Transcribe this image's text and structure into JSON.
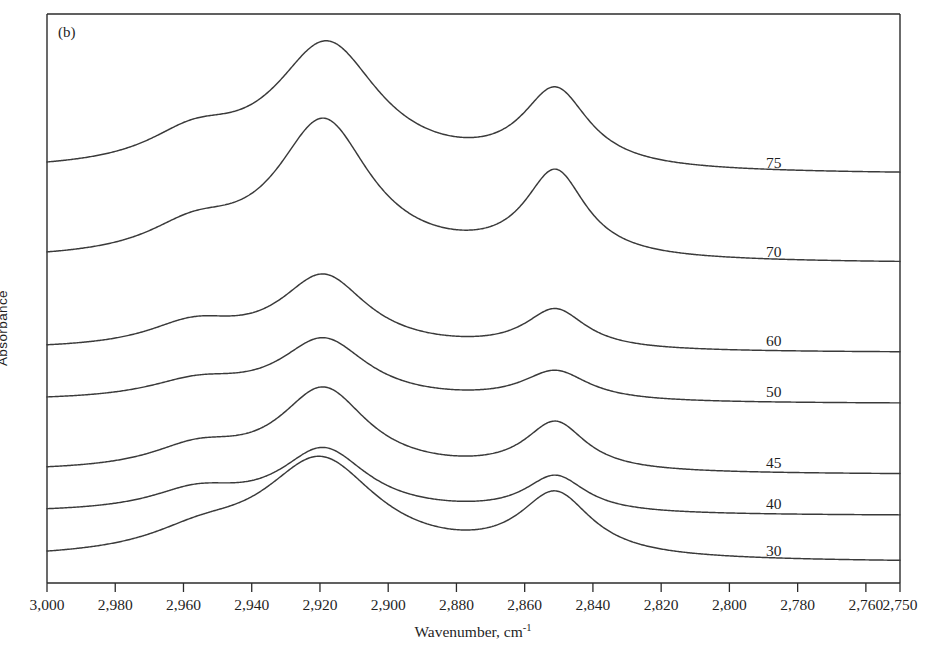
{
  "figure": {
    "panel_label": "(b)",
    "y_axis_label": "Absorbance",
    "x_axis_label": "Wavenumber, cm",
    "x_axis_label_sup": "-1"
  },
  "chart_data": {
    "type": "line",
    "title": "",
    "subtitle": "",
    "panel": "(b)",
    "xlabel": "Wavenumber, cm^-1",
    "ylabel": "Absorbance",
    "xlim": [
      3000,
      2750
    ],
    "x_axis_reversed": true,
    "ylim_units": "arbitrary (stacked offset traces)",
    "grid": false,
    "legend": "inline right-side curve labels",
    "xticks": [
      3000,
      2980,
      2960,
      2940,
      2920,
      2900,
      2880,
      2860,
      2840,
      2820,
      2800,
      2780,
      2760,
      2750
    ],
    "xtick_labels": [
      "3,000",
      "2,980",
      "2,960",
      "2,940",
      "2,920",
      "2,900",
      "2,880",
      "2,860",
      "2,840",
      "2,820",
      "2,800",
      "2,780",
      "2,760",
      "2,750"
    ],
    "yticks": [],
    "ytick_labels": [],
    "peak_positions_cm1": [
      2957,
      2918,
      2850
    ],
    "peak_assignments": [
      "CH3 asymmetric stretch",
      "CH2 asymmetric stretch",
      "CH2 symmetric stretch"
    ],
    "series": [
      {
        "name": "75",
        "label": "75",
        "baseline_offset": 175,
        "label_x_cm1": 2787,
        "peaks": [
          {
            "center": 2957,
            "height": 30,
            "width": 17
          },
          {
            "center": 2918,
            "height": 127,
            "width": 19
          },
          {
            "center": 2851,
            "height": 78,
            "width": 12
          }
        ]
      },
      {
        "name": "70",
        "label": "70",
        "baseline_offset": 264,
        "label_x_cm1": 2787,
        "peaks": [
          {
            "center": 2957,
            "height": 28,
            "width": 17
          },
          {
            "center": 2919,
            "height": 139,
            "width": 17
          },
          {
            "center": 2851,
            "height": 86,
            "width": 11
          }
        ]
      },
      {
        "name": "60",
        "label": "60",
        "baseline_offset": 353,
        "label_x_cm1": 2787,
        "peaks": [
          {
            "center": 2957,
            "height": 24,
            "width": 17
          },
          {
            "center": 2919,
            "height": 74,
            "width": 16
          },
          {
            "center": 2851,
            "height": 40,
            "width": 11
          }
        ]
      },
      {
        "name": "50",
        "label": "50",
        "baseline_offset": 404,
        "label_x_cm1": 2787,
        "peaks": [
          {
            "center": 2956,
            "height": 18,
            "width": 18
          },
          {
            "center": 2919,
            "height": 62,
            "width": 16
          },
          {
            "center": 2851,
            "height": 30,
            "width": 12
          }
        ]
      },
      {
        "name": "45",
        "label": "45",
        "baseline_offset": 475,
        "label_x_cm1": 2787,
        "peaks": [
          {
            "center": 2956,
            "height": 22,
            "width": 17
          },
          {
            "center": 2919,
            "height": 83,
            "width": 16
          },
          {
            "center": 2851,
            "height": 49,
            "width": 11
          }
        ]
      },
      {
        "name": "40",
        "label": "40",
        "baseline_offset": 516,
        "label_x_cm1": 2787,
        "peaks": [
          {
            "center": 2956,
            "height": 21,
            "width": 17
          },
          {
            "center": 2919,
            "height": 64,
            "width": 16
          },
          {
            "center": 2851,
            "height": 37,
            "width": 11
          }
        ]
      },
      {
        "name": "30",
        "label": "30",
        "baseline_offset": 563,
        "label_x_cm1": 2787,
        "peaks": [
          {
            "center": 2955,
            "height": 20,
            "width": 19
          },
          {
            "center": 2920,
            "height": 100,
            "width": 21
          },
          {
            "center": 2851,
            "height": 63,
            "width": 13
          }
        ]
      }
    ]
  },
  "colors": {
    "curve": "#3a3a3a",
    "axis": "#2b2b2b",
    "text": "#1f1f1f",
    "background": "#ffffff"
  }
}
